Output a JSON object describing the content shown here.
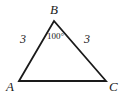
{
  "figure": {
    "type": "geometry-diagram",
    "shape": "triangle",
    "background_color": "#ffffff",
    "stroke_color": "#1a1a1a",
    "stroke_width": 1.8,
    "width": 122,
    "height": 98,
    "vertices": [
      {
        "name": "A",
        "label": "A",
        "x": 19,
        "y": 81
      },
      {
        "name": "B",
        "label": "B",
        "x": 54,
        "y": 21
      },
      {
        "name": "C",
        "label": "C",
        "x": 106,
        "y": 81
      }
    ],
    "sides": [
      {
        "name": "AB",
        "label": "3",
        "from": "A",
        "to": "B"
      },
      {
        "name": "BC",
        "label": "3",
        "from": "B",
        "to": "C"
      },
      {
        "name": "AC",
        "label": "",
        "from": "A",
        "to": "C"
      }
    ],
    "angles": [
      {
        "name": "B",
        "label": "100°",
        "at": "B",
        "value": 100,
        "unit": "degrees"
      }
    ]
  }
}
